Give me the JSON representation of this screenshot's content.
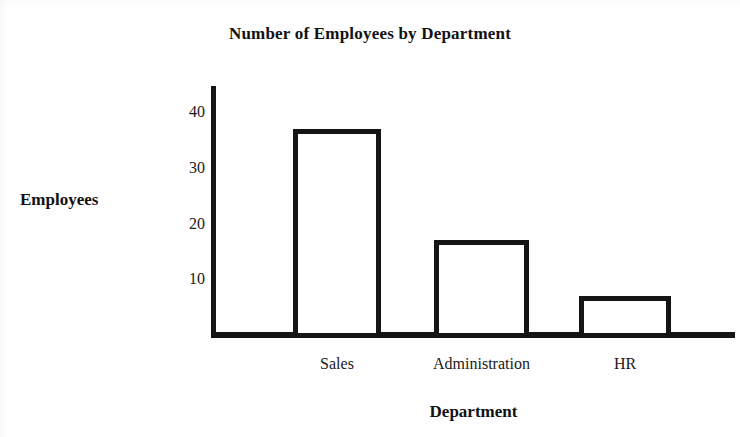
{
  "chart_data": {
    "type": "bar",
    "title": "Number of Employees by Department",
    "xlabel": "Department",
    "ylabel": "Employees",
    "categories": [
      "Sales",
      "Administration",
      "HR"
    ],
    "values": [
      37,
      17,
      7
    ],
    "ytick_labels": [
      "10",
      "20",
      "30",
      "40"
    ],
    "ytick_values": [
      10,
      20,
      30,
      40
    ],
    "ylim": [
      0,
      46
    ],
    "grid": false,
    "legend": false,
    "bar_fill_color": "#ffffff",
    "bar_edge_color": "#151515",
    "axis_color": "#151515",
    "background_color": "#fefefe"
  }
}
